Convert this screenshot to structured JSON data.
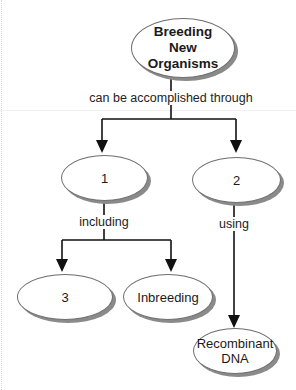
{
  "diagram": {
    "type": "concept-map",
    "nodes": {
      "root": {
        "label": "Breeding\nNew\nOrganisms"
      },
      "n1": {
        "label": "1"
      },
      "n2": {
        "label": "2"
      },
      "n3": {
        "label": "3"
      },
      "inbreeding": {
        "label": "Inbreeding"
      },
      "recombinant": {
        "label": "Recombinant\nDNA"
      }
    },
    "links": {
      "root_to_children": {
        "label": "can be accomplished through"
      },
      "n1_to_children": {
        "label": "including"
      },
      "n2_to_recombinant": {
        "label": "using"
      }
    },
    "colors": {
      "line": "#111111",
      "node_border": "#6e6e6e",
      "node_shadow": "#8a8a8a",
      "background": "#ffffff"
    }
  }
}
